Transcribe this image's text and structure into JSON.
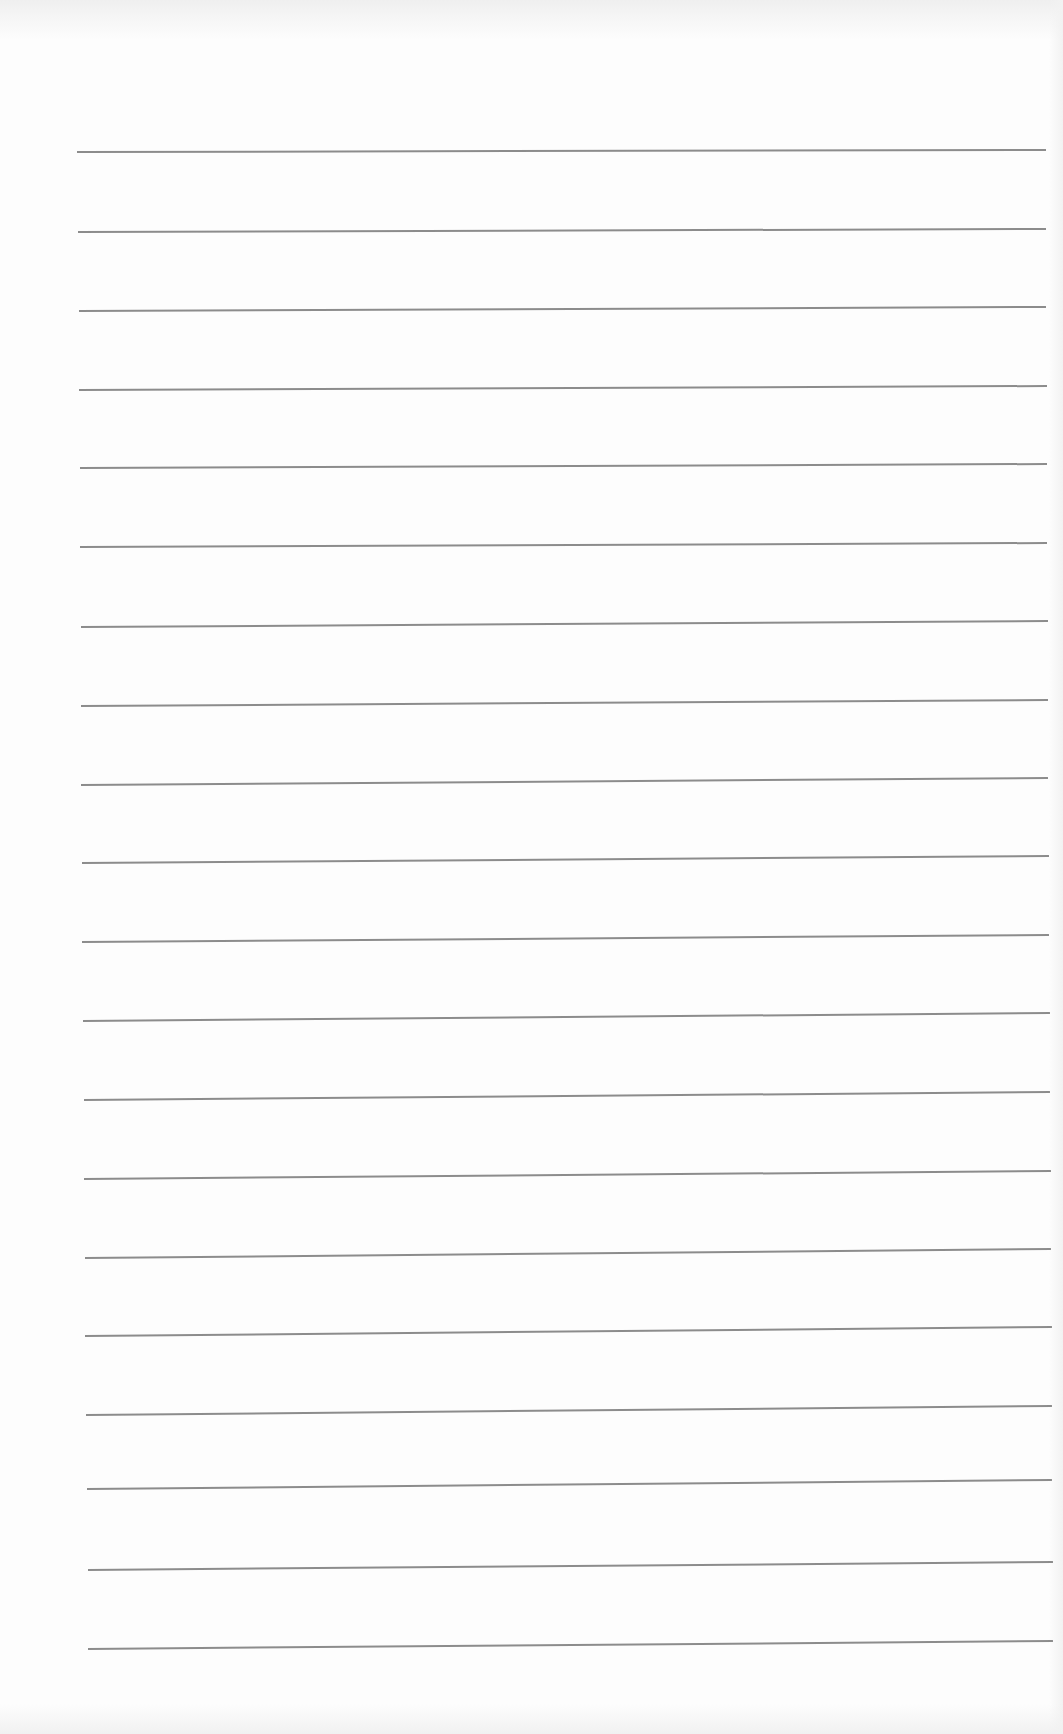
{
  "page": {
    "type": "blank-lined-paper",
    "background": "#fdfdfd",
    "line_color": "#8c8c8c",
    "line_count": 20,
    "lines": [
      {
        "x1": 77,
        "y1": 152,
        "x2": 1046,
        "y2": 150
      },
      {
        "x1": 78,
        "y1": 232,
        "x2": 1046,
        "y2": 229
      },
      {
        "x1": 79,
        "y1": 311,
        "x2": 1046,
        "y2": 307
      },
      {
        "x1": 79,
        "y1": 390,
        "x2": 1047,
        "y2": 386
      },
      {
        "x1": 80,
        "y1": 468,
        "x2": 1047,
        "y2": 464
      },
      {
        "x1": 80,
        "y1": 547,
        "x2": 1047,
        "y2": 543
      },
      {
        "x1": 81,
        "y1": 627,
        "x2": 1048,
        "y2": 621
      },
      {
        "x1": 81,
        "y1": 706,
        "x2": 1048,
        "y2": 700
      },
      {
        "x1": 81,
        "y1": 785,
        "x2": 1048,
        "y2": 778
      },
      {
        "x1": 82,
        "y1": 863,
        "x2": 1049,
        "y2": 856
      },
      {
        "x1": 82,
        "y1": 942,
        "x2": 1049,
        "y2": 935
      },
      {
        "x1": 83,
        "y1": 1021,
        "x2": 1050,
        "y2": 1013
      },
      {
        "x1": 84,
        "y1": 1100,
        "x2": 1050,
        "y2": 1092
      },
      {
        "x1": 84,
        "y1": 1179,
        "x2": 1051,
        "y2": 1171
      },
      {
        "x1": 85,
        "y1": 1258,
        "x2": 1051,
        "y2": 1249
      },
      {
        "x1": 85,
        "y1": 1336,
        "x2": 1052,
        "y2": 1327
      },
      {
        "x1": 86,
        "y1": 1415,
        "x2": 1052,
        "y2": 1406
      },
      {
        "x1": 87,
        "y1": 1489,
        "x2": 1052,
        "y2": 1480
      },
      {
        "x1": 88,
        "y1": 1570,
        "x2": 1053,
        "y2": 1562
      },
      {
        "x1": 88,
        "y1": 1649,
        "x2": 1053,
        "y2": 1641
      }
    ],
    "text": ""
  }
}
